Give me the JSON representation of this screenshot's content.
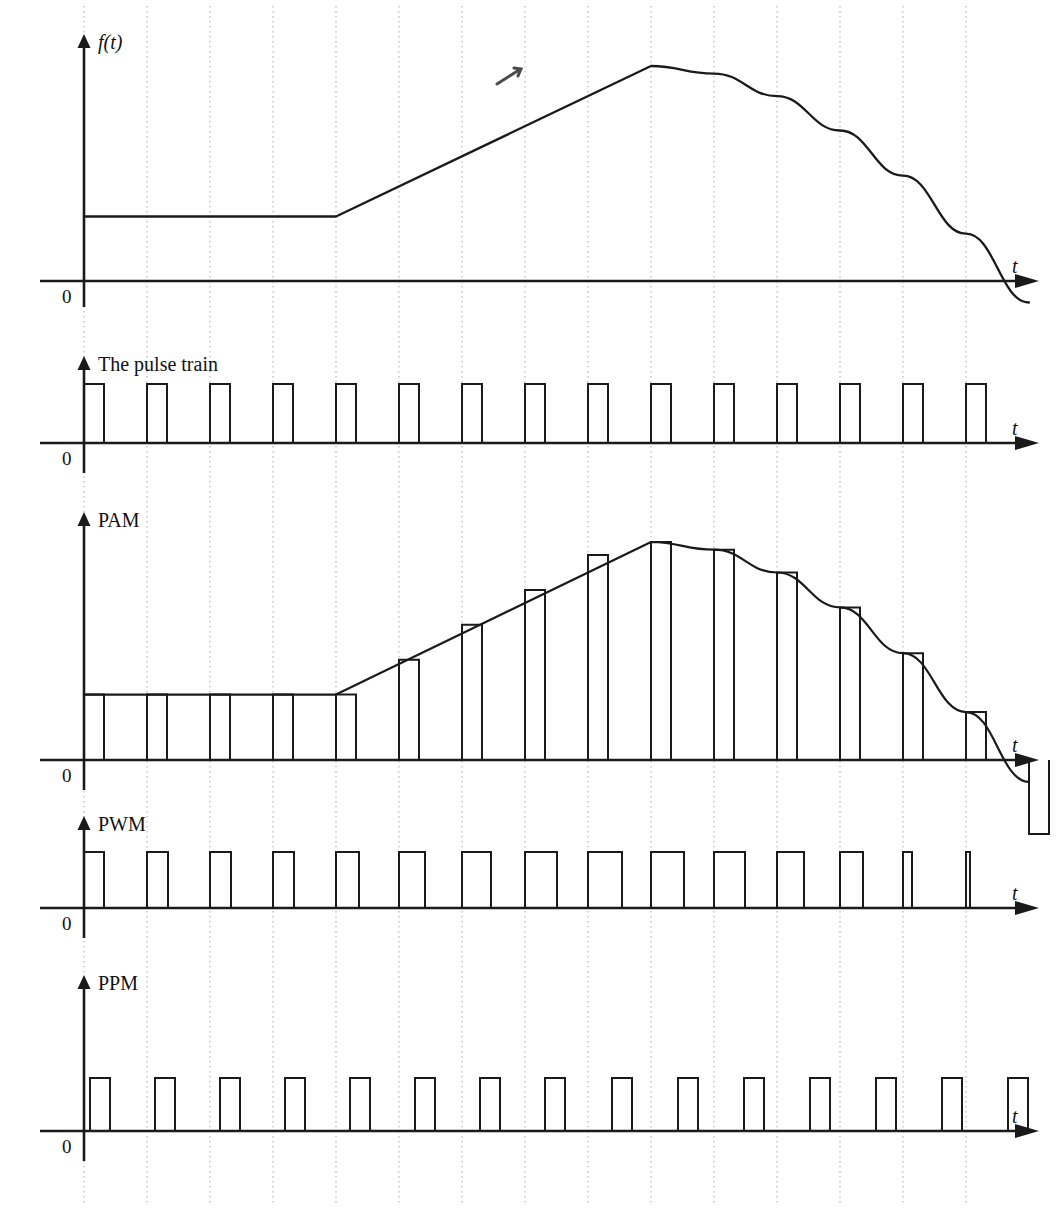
{
  "figure": {
    "title_implicit": "Pulse modulation waveforms",
    "background": "#ffffff",
    "ink": "#1a1a1a",
    "grid_color": "#9a9a9a",
    "width": 1056,
    "height": 1210
  },
  "axis_labels": {
    "t": "t",
    "zero": "0",
    "signal": "f(t)"
  },
  "panels": [
    {
      "id": "signal",
      "label": "f(t)",
      "label_italic": true,
      "baseline_y": 281,
      "axis_x": 84,
      "axis_top": 34,
      "axis_right": 1035,
      "t_label_x": 1012,
      "t_label_y": 256,
      "zero_x": 62,
      "zero_y": 287
    },
    {
      "id": "pulse-train",
      "label": "The pulse train",
      "label_italic": false,
      "baseline_y": 443,
      "axis_x": 84,
      "axis_top": 356,
      "axis_right": 1035,
      "t_label_x": 1012,
      "t_label_y": 418,
      "zero_x": 62,
      "zero_y": 449
    },
    {
      "id": "pam",
      "label": "PAM",
      "label_italic": false,
      "baseline_y": 760,
      "axis_x": 84,
      "axis_top": 512,
      "axis_right": 1035,
      "t_label_x": 1012,
      "t_label_y": 735,
      "zero_x": 62,
      "zero_y": 766
    },
    {
      "id": "pwm",
      "label": "PWM",
      "label_italic": false,
      "baseline_y": 908,
      "axis_x": 84,
      "axis_top": 816,
      "axis_right": 1035,
      "t_label_x": 1012,
      "t_label_y": 883,
      "zero_x": 62,
      "zero_y": 914
    },
    {
      "id": "ppm",
      "label": "PPM",
      "label_italic": false,
      "baseline_y": 1131,
      "axis_x": 84,
      "axis_top": 975,
      "axis_right": 1035,
      "t_label_x": 1012,
      "t_label_y": 1106,
      "zero_x": 62,
      "zero_y": 1137
    }
  ],
  "chart_data": {
    "type": "line",
    "xlabel": "t",
    "ylabel": "f(t)",
    "grid": true,
    "legend": null,
    "grid_x_start": 84,
    "grid_spacing": 63,
    "grid_count": 15,
    "gridlines_x": [
      84,
      147,
      210,
      273,
      336,
      399,
      462,
      525,
      588,
      651,
      714,
      777,
      840,
      903,
      966
    ],
    "sample_count": 15,
    "signal": {
      "name": "f(t)",
      "description": "Flat DC level, then linear ramp up to a peak, then smooth decay crossing zero near the right",
      "normalized_levels": [
        0.3,
        0.3,
        0.3,
        0.3,
        0.3,
        0.46,
        0.62,
        0.78,
        0.94,
        1.0,
        0.965,
        0.86,
        0.7,
        0.49,
        0.22,
        -0.1
      ],
      "peak_at_gridline_index": 9,
      "zero_crossing_near_gridline_index": 14
    },
    "pulse_train": {
      "name": "The pulse train",
      "amplitude_uniform": 1.0,
      "width_uniform_px": 20,
      "count": 15,
      "description": "Uniform rectangular sampling pulses of constant height and width, one per grid interval"
    },
    "pam": {
      "name": "PAM",
      "description": "Pulse Amplitude Modulation — pulse heights follow the signal envelope; last sample is negative (below axis)",
      "amplitudes": [
        0.3,
        0.3,
        0.3,
        0.3,
        0.3,
        0.46,
        0.62,
        0.78,
        0.94,
        1.0,
        0.965,
        0.86,
        0.7,
        0.49,
        0.22,
        -0.34
      ],
      "width_uniform_px": 20
    },
    "pwm": {
      "name": "PWM",
      "description": "Pulse Width Modulation — constant height, pulse widths proportional to the signal amplitude; widths shrink to slivers as the signal falls",
      "amplitude_uniform": 1.0,
      "widths_px": [
        20,
        21,
        21,
        21,
        23,
        26,
        29,
        32,
        34,
        33,
        31,
        27,
        23,
        9,
        4
      ]
    },
    "ppm": {
      "name": "PPM",
      "description": "Pulse Position Modulation — constant height and width; the pulse position within each interval shifts with the signal amplitude",
      "amplitude_uniform": 1.0,
      "width_uniform_px": 20,
      "offsets_px": [
        6,
        8,
        10,
        12,
        14,
        16,
        18,
        20,
        24,
        27,
        30,
        33,
        36,
        39,
        42
      ]
    }
  }
}
